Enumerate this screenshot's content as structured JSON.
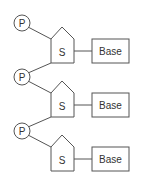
{
  "diagram": {
    "title": "",
    "stroke_color": "#555555",
    "units": [
      {
        "phosphate": "P",
        "sugar": "S",
        "base": "Base",
        "offset_y": 0
      },
      {
        "phosphate": "P",
        "sugar": "S",
        "base": "Base",
        "offset_y": 54
      },
      {
        "phosphate": "P",
        "sugar": "S",
        "base": "Base",
        "offset_y": 108
      }
    ]
  }
}
